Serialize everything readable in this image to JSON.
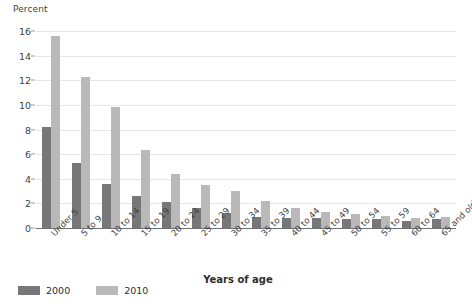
{
  "chart_data": {
    "type": "bar",
    "title": "",
    "subtitle": "",
    "xlabel": "Years of age",
    "ylabel": "Percent",
    "ylim": [
      0,
      16
    ],
    "ytick_step": 2,
    "yticks": [
      "16",
      "14",
      "12",
      "10",
      "8",
      "6",
      "4",
      "2",
      "0"
    ],
    "grid": true,
    "legend_position": "bottom-left",
    "categories": [
      "Under 5",
      "5 to 9",
      "10 to 14",
      "15 to 19",
      "20 to 24",
      "25 to 29",
      "30 to 34",
      "35 to 39",
      "40 to 44",
      "45 to 49",
      "50 to 54",
      "55 to 59",
      "60 to 64",
      "65 and older"
    ],
    "series": [
      {
        "name": "2000",
        "color": "#777777",
        "values": [
          8.2,
          5.3,
          3.6,
          2.6,
          2.1,
          1.6,
          1.2,
          0.9,
          0.8,
          0.8,
          0.7,
          0.7,
          0.6,
          0.7
        ]
      },
      {
        "name": "2010",
        "color": "#b9b9b9",
        "values": [
          15.6,
          12.3,
          9.8,
          6.3,
          4.4,
          3.5,
          3.0,
          2.2,
          1.6,
          1.3,
          1.1,
          1.0,
          0.8,
          0.9
        ]
      }
    ]
  },
  "legend": {
    "items": [
      {
        "label": "2000",
        "color": "#777777"
      },
      {
        "label": "2010",
        "color": "#b9b9b9"
      }
    ]
  },
  "colors": {
    "series_2000": "#777777",
    "series_2010": "#b9b9b9",
    "gridline": "#e6e6e6",
    "axis": "#6f6f6f",
    "text": "#3f3f3f"
  }
}
